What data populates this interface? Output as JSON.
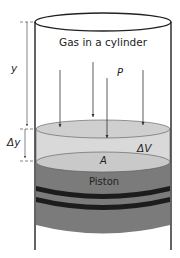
{
  "diagram": {
    "title": "Gas in a cylinder",
    "labels": {
      "pressure": "P",
      "height": "y",
      "height_change": "Δy",
      "volume_change": "ΔV",
      "area": "A",
      "piston": "Piston"
    },
    "colors": {
      "gas_volume": "#d8d8d8",
      "piston_top": "#c8c8c8",
      "piston_body": "#7a7a7a",
      "piston_rings": "#1a1a1a",
      "outline": "#222222"
    },
    "arrow_count": 4
  }
}
